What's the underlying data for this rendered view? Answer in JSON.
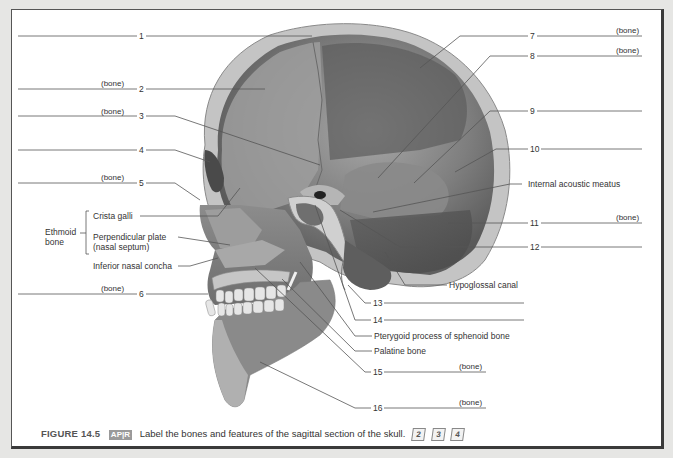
{
  "figure": {
    "caption_number": "FIGURE 14.5",
    "caption_badge": "AP|R",
    "caption_text": "Label the bones and features of the sagittal section of the skull.",
    "caption_levels": [
      "2",
      "3",
      "4"
    ]
  },
  "left_labels": [
    {
      "num": "1",
      "hint": ""
    },
    {
      "num": "2",
      "hint": "(bone)"
    },
    {
      "num": "3",
      "hint": "(bone)"
    },
    {
      "num": "4",
      "hint": ""
    },
    {
      "num": "5",
      "hint": "(bone)"
    },
    {
      "num": "6",
      "hint": "(bone)"
    }
  ],
  "right_labels": [
    {
      "num": "7",
      "hint": "(bone)"
    },
    {
      "num": "8",
      "hint": "(bone)"
    },
    {
      "num": "9",
      "hint": ""
    },
    {
      "num": "10",
      "hint": ""
    },
    {
      "num": "11",
      "hint": "(bone)"
    },
    {
      "num": "12",
      "hint": ""
    }
  ],
  "bottom_labels": [
    {
      "num": "13",
      "hint": ""
    },
    {
      "num": "14",
      "hint": ""
    },
    {
      "num": "15",
      "hint": "(bone)"
    },
    {
      "num": "16",
      "hint": "(bone)"
    }
  ],
  "named_labels": {
    "ethmoid_group": "Ethmoid",
    "ethmoid_group_2": "bone",
    "crista_galli": "Crista galli",
    "perpendicular_plate": "Perpendicular plate",
    "nasal_septum": "(nasal septum)",
    "inferior_nasal_concha": "Inferior nasal concha",
    "internal_acoustic_meatus": "Internal acoustic meatus",
    "hypoglossal_canal": "Hypoglossal canal",
    "pterygoid_process": "Pterygoid process of sphenoid bone",
    "palatine_bone": "Palatine bone"
  }
}
